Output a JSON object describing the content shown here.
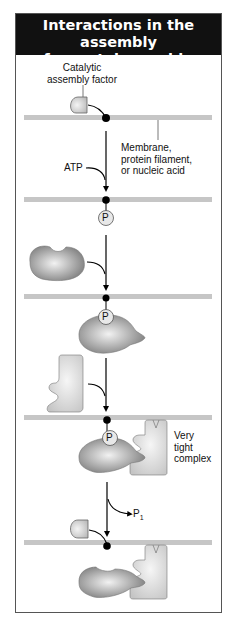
{
  "title": {
    "line1": "Interactions in the assembly",
    "line2": "of a protein machine"
  },
  "labels": {
    "catalytic_factor": {
      "line1": "Catalytic",
      "line2": "assembly factor"
    },
    "membrane": {
      "line1": "Membrane,",
      "line2": "protein filament,",
      "line3": "or nucleic acid"
    },
    "atp": "ATP",
    "phosphate": "P",
    "tight_complex": {
      "line1": "Very",
      "line2": "tight",
      "line3": "complex"
    },
    "released_phosphate": "P",
    "released_phosphate_sub": "1"
  },
  "colors": {
    "header_bg": "#111111",
    "membrane": "#c6c6c6",
    "protein_dark": "#8a8a8a",
    "protein_light": "#e0e0e0",
    "anchor_dot": "#000000"
  }
}
